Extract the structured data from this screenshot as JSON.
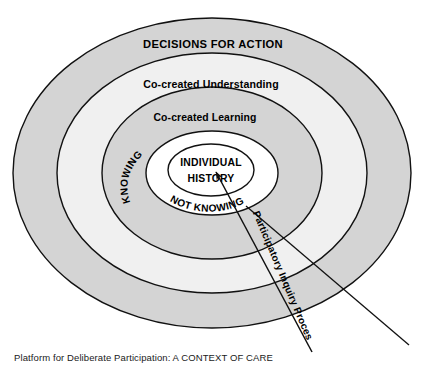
{
  "diagram": {
    "title": "Platform for Deliberate Participation: A CONTEXT OF CARE",
    "type": "concentric-ellipse-onion",
    "rings": [
      {
        "id": "outer",
        "label": "DECISIONS FOR ACTION",
        "fill": "#d4d4d4",
        "label_style": "uppercase-bold"
      },
      {
        "id": "second",
        "label": "Co-created Understanding",
        "fill": "#f0f0f0",
        "label_style": "titlecase-bold"
      },
      {
        "id": "third",
        "label": "Co-created Learning",
        "fill": "#d4d4d4",
        "label_style": "titlecase-bold"
      },
      {
        "id": "fourth",
        "label": "",
        "fill": "#ffffff",
        "label_style": "none"
      },
      {
        "id": "core",
        "label": "INDIVIDUAL HISTORY",
        "label_line1": "INDIVIDUAL",
        "label_line2": "HISTORY",
        "fill": "#ffffff",
        "label_style": "uppercase-bold"
      }
    ],
    "arc_labels": [
      {
        "id": "knowing",
        "text": "KNOWING"
      },
      {
        "id": "not-knowing",
        "text": "NOT KNOWING"
      }
    ],
    "process_arrow": {
      "label": "Participatory Inquiry Process",
      "direction": "up-left toward core"
    },
    "colors": {
      "stroke": "#111111",
      "gray_band": "#d4d4d4",
      "light_band": "#f0f0f0",
      "white": "#ffffff",
      "text": "#000000"
    }
  },
  "caption": {
    "text": "Platform for Deliberate Participation: A CONTEXT OF CARE"
  }
}
